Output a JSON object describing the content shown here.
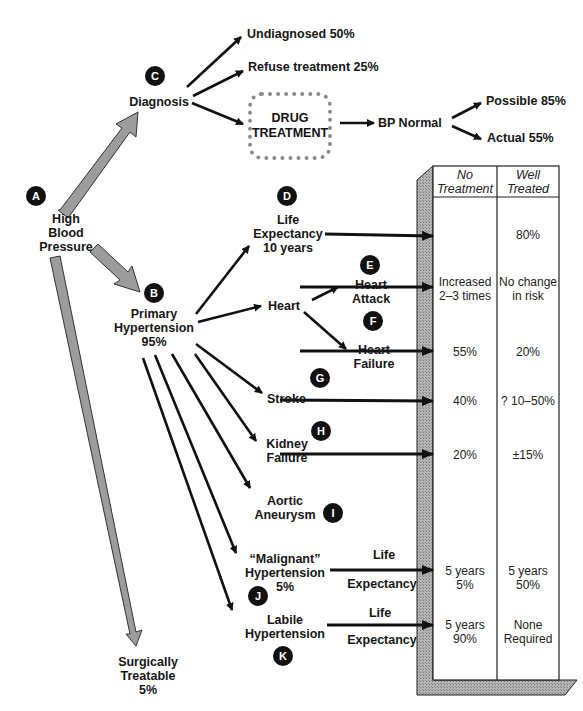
{
  "nodes": {
    "high_bp": {
      "badge": "A",
      "lines": [
        "High",
        "Blood",
        "Pressure"
      ]
    },
    "primary": {
      "badge": "B",
      "lines": [
        "Primary",
        "Hypertension",
        "95%"
      ]
    },
    "diagnosis": {
      "badge": "C",
      "label": "Diagnosis"
    },
    "undiagnosed": {
      "label": "Undiagnosed 50%"
    },
    "refuse": {
      "label": "Refuse treatment 25%"
    },
    "drug_treatment": {
      "lines": [
        "DRUG",
        "TREATMENT"
      ]
    },
    "bp_normal": {
      "label": "BP Normal"
    },
    "possible": {
      "label": "Possible 85%"
    },
    "actual": {
      "label": "Actual 55%"
    },
    "life_expectancy": {
      "badge": "D",
      "lines": [
        "Life",
        "Expectancy",
        "10 years"
      ]
    },
    "heart": {
      "label": "Heart"
    },
    "heart_attack": {
      "badge": "E",
      "lines": [
        "Heart",
        "Attack"
      ]
    },
    "heart_failure": {
      "badge": "F",
      "lines": [
        "Heart",
        "Failure"
      ]
    },
    "stroke": {
      "badge": "G",
      "label": "Stroke"
    },
    "kidney_failure": {
      "badge": "H",
      "lines": [
        "Kidney",
        "Failure"
      ]
    },
    "aortic_aneurysm": {
      "badge": "I",
      "lines": [
        "Aortic",
        "Aneurysm"
      ]
    },
    "malignant": {
      "badge": "J",
      "lines": [
        "“Malignant”",
        "Hypertension",
        "5%"
      ],
      "arrow_top": "Life",
      "arrow_bottom": "Expectancy"
    },
    "labile": {
      "badge": "K",
      "lines": [
        "Labile",
        "Hypertension"
      ],
      "arrow_top": "Life",
      "arrow_bottom": "Expectancy"
    },
    "surgical": {
      "lines": [
        "Surgically",
        "Treatable",
        "5%"
      ]
    }
  },
  "table": {
    "headers": [
      [
        "No",
        "Treatment"
      ],
      [
        "Well",
        "Treated"
      ]
    ],
    "rows": [
      {
        "name": "life-expectancy",
        "no_treatment": [
          ""
        ],
        "well_treated": [
          "80%"
        ]
      },
      {
        "name": "heart-attack",
        "no_treatment": [
          "Increased",
          "2–3 times"
        ],
        "well_treated": [
          "No change",
          "in risk"
        ]
      },
      {
        "name": "heart-failure",
        "no_treatment": [
          "55%"
        ],
        "well_treated": [
          "20%"
        ]
      },
      {
        "name": "stroke",
        "no_treatment": [
          "40%"
        ],
        "well_treated": [
          "? 10–50%"
        ]
      },
      {
        "name": "kidney-failure",
        "no_treatment": [
          "20%"
        ],
        "well_treated": [
          "±15%"
        ]
      },
      {
        "name": "malignant",
        "no_treatment": [
          "5 years",
          "5%"
        ],
        "well_treated": [
          "5 years",
          "50%"
        ]
      },
      {
        "name": "labile",
        "no_treatment": [
          "5 years",
          "90%"
        ],
        "well_treated": [
          "None",
          "Required"
        ]
      }
    ]
  },
  "colors": {
    "ink": "#111111",
    "grey_arrow": "#9a9a9a",
    "shade": "#a8a8a8"
  }
}
